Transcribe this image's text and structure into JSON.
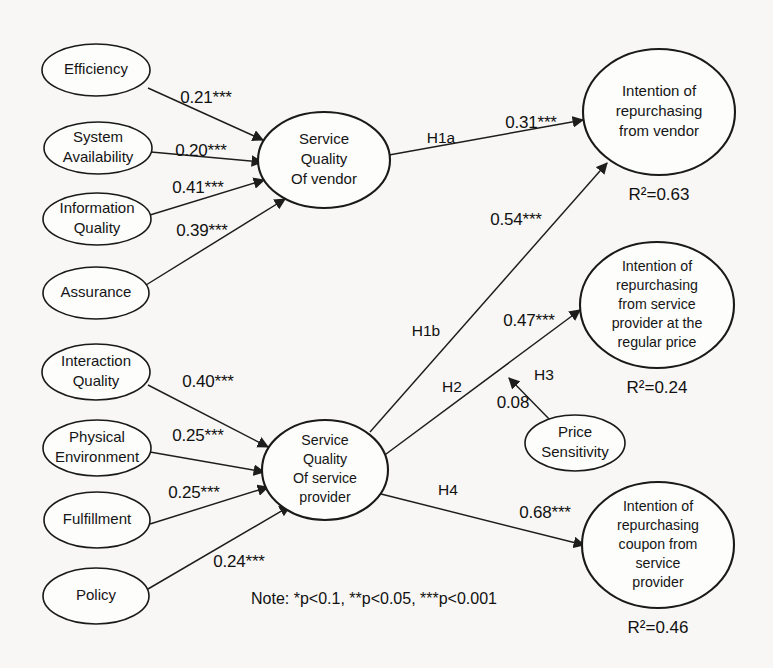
{
  "figure": {
    "type": "path-diagram",
    "background_color": "#f8f7f5",
    "stroke_color": "#1a1a1a",
    "note": "Note: *p<0.1, **p<0.05, ***p<0.001"
  },
  "nodes": {
    "efficiency": {
      "label": "Efficiency",
      "shape": "ellipse",
      "cx": 96,
      "cy": 70,
      "rx": 54,
      "ry": 26
    },
    "system_availability": {
      "label_line1": "System",
      "label_line2": "Availability",
      "shape": "ellipse",
      "cx": 98,
      "cy": 148,
      "rx": 54,
      "ry": 26
    },
    "information_quality": {
      "label_line1": "Information",
      "label_line2": "Quality",
      "shape": "ellipse",
      "cx": 97,
      "cy": 219,
      "rx": 54,
      "ry": 26
    },
    "assurance": {
      "label": "Assurance",
      "shape": "ellipse",
      "cx": 96,
      "cy": 293,
      "rx": 53,
      "ry": 26
    },
    "interaction_quality": {
      "label_line1": "Interaction",
      "label_line2": "Quality",
      "shape": "ellipse",
      "cx": 96,
      "cy": 372,
      "rx": 54,
      "ry": 28
    },
    "physical_environment": {
      "label_line1": "Physical",
      "label_line2": "Environment",
      "shape": "ellipse",
      "cx": 97,
      "cy": 448,
      "rx": 54,
      "ry": 28
    },
    "fulfillment": {
      "label": "Fulfillment",
      "shape": "ellipse",
      "cx": 97,
      "cy": 520,
      "rx": 53,
      "ry": 28
    },
    "policy": {
      "label": "Policy",
      "shape": "ellipse",
      "cx": 96,
      "cy": 596,
      "rx": 53,
      "ry": 28
    },
    "sq_vendor": {
      "label_line1": "Service",
      "label_line2": "Quality",
      "label_line3": "Of vendor",
      "shape": "ellipse",
      "cx": 324,
      "cy": 160,
      "rx": 66,
      "ry": 48
    },
    "sq_service_provider": {
      "label_line1": "Service",
      "label_line2": "Quality",
      "label_line3": "Of service",
      "label_line4": "provider",
      "shape": "ellipse",
      "cx": 325,
      "cy": 470,
      "rx": 63,
      "ry": 50
    },
    "price_sensitivity": {
      "label_line1": "Price",
      "label_line2": "Sensitivity",
      "shape": "ellipse",
      "cx": 575,
      "cy": 443,
      "rx": 50,
      "ry": 28
    },
    "intention_vendor": {
      "label_line1": "Intention of",
      "label_line2": "repurchasing",
      "label_line3": "from vendor",
      "shape": "circle",
      "cx": 659,
      "cy": 112,
      "rx": 76,
      "ry": 63,
      "r2": "R²=0.63",
      "r2_value": 0.63,
      "r2_x": 659,
      "r2_y": 196
    },
    "intention_regular_price": {
      "label_line1": "Intention of",
      "label_line2": "repurchasing",
      "label_line3": "from  service",
      "label_line4": "provider at the",
      "label_line5": "regular price",
      "shape": "circle",
      "cx": 657,
      "cy": 305,
      "rx": 77,
      "ry": 63,
      "r2": "R²=0.24",
      "r2_value": 0.24,
      "r2_x": 657,
      "r2_y": 389
    },
    "intention_coupon": {
      "label_line1": "Intention of",
      "label_line2": "repurchasing",
      "label_line3": "coupon from",
      "label_line4": "service",
      "label_line5": "provider",
      "shape": "circle",
      "cx": 658,
      "cy": 545,
      "rx": 76,
      "ry": 63,
      "r2": "R²=0.46",
      "r2_value": 0.46,
      "r2_x": 658,
      "r2_y": 629
    }
  },
  "edges": [
    {
      "id": "efficiency-to-sqv",
      "from": "efficiency",
      "to": "sq_vendor",
      "coefficient": "0.21***",
      "value": 0.21,
      "label_x": 206,
      "label_y": 99,
      "path": "M 148 88 L 263 140"
    },
    {
      "id": "sysavail-to-sqv",
      "from": "system_availability",
      "to": "sq_vendor",
      "coefficient": "0.20***",
      "value": 0.2,
      "label_x": 201,
      "label_y": 152,
      "path": "M 151 152 L 262 162"
    },
    {
      "id": "infoqual-to-sqv",
      "from": "information_quality",
      "to": "sq_vendor",
      "coefficient": "0.41***",
      "value": 0.41,
      "label_x": 198,
      "label_y": 189,
      "path": "M 150 215 L 264 180"
    },
    {
      "id": "assurance-to-sqv",
      "from": "assurance",
      "to": "sq_vendor",
      "coefficient": "0.39***",
      "value": 0.39,
      "label_x": 202,
      "label_y": 232,
      "path": "M 146 285 L 285 199"
    },
    {
      "id": "interaction-to-sqsp",
      "from": "interaction_quality",
      "to": "sq_service_provider",
      "coefficient": "0.40***",
      "value": 0.4,
      "label_x": 208,
      "label_y": 383,
      "path": "M 148 385 L 268 447"
    },
    {
      "id": "physenv-to-sqsp",
      "from": "physical_environment",
      "to": "sq_service_provider",
      "coefficient": "0.25***",
      "value": 0.25,
      "label_x": 198,
      "label_y": 437,
      "path": "M 150 452 L 264 472"
    },
    {
      "id": "fulfillment-to-sqsp",
      "from": "fulfillment",
      "to": "sq_service_provider",
      "coefficient": "0.25***",
      "value": 0.25,
      "label_x": 194,
      "label_y": 494,
      "path": "M 150 524 L 268 487"
    },
    {
      "id": "policy-to-sqsp",
      "from": "policy",
      "to": "sq_service_provider",
      "coefficient": "0.24***",
      "value": 0.24,
      "label_x": 239,
      "label_y": 563,
      "path": "M 148 589 L 290 506"
    },
    {
      "id": "sqv-to-intvendor",
      "from": "sq_vendor",
      "to": "intention_vendor",
      "coefficient": "0.31***",
      "value": 0.31,
      "label_x": 531,
      "label_y": 124,
      "hypothesis": "H1a",
      "h_x": 441,
      "h_y": 139,
      "path": "M 389 155 L 583 120"
    },
    {
      "id": "sqsp-to-intvendor",
      "from": "sq_service_provider",
      "to": "intention_vendor",
      "coefficient": "0.54***",
      "value": 0.54,
      "label_x": 516,
      "label_y": 221,
      "hypothesis": "H1b",
      "h_x": 426,
      "h_y": 332,
      "path": "M 370 432 L 607 163"
    },
    {
      "id": "sqsp-to-intregular",
      "from": "sq_service_provider",
      "to": "intention_regular_price",
      "coefficient": "0.47***",
      "value": 0.47,
      "label_x": 529,
      "label_y": 322,
      "hypothesis": "H2",
      "h_x": 452,
      "h_y": 388,
      "path": "M 378 460 L 580 310"
    },
    {
      "id": "price-to-intregular",
      "from": "price_sensitivity",
      "to": "sqsp-to-intregular",
      "coefficient": "0.08",
      "value": 0.08,
      "label_x": 513,
      "label_y": 404,
      "hypothesis": "H3",
      "h_x": 544,
      "h_y": 376,
      "path": "M 553 423 L 509 378"
    },
    {
      "id": "sqsp-to-intcoupon",
      "from": "sq_service_provider",
      "to": "intention_coupon",
      "coefficient": "0.68***",
      "value": 0.68,
      "label_x": 545,
      "label_y": 514,
      "hypothesis": "H4",
      "h_x": 448,
      "h_y": 491,
      "path": "M 381 494 L 584 545"
    }
  ]
}
